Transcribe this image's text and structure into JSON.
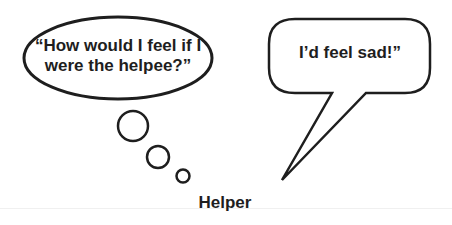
{
  "thought_bubble": {
    "text": "“How would I feel if I were the helpee?”"
  },
  "speech_bubble": {
    "text": "I’d feel sad!”"
  },
  "caption": {
    "text": "Helper"
  },
  "colors": {
    "stroke": "#1e1e1e",
    "background": "#ffffff"
  }
}
